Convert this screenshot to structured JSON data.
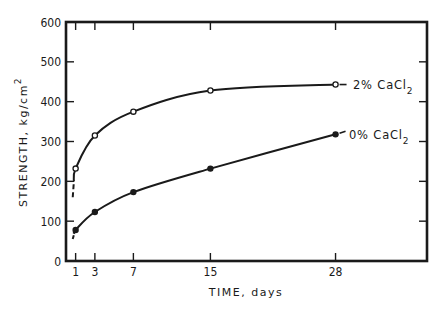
{
  "chart_data": {
    "type": "line",
    "title": "",
    "xlabel": "TIME, days",
    "ylabel": "STRENGTH, kg/cm",
    "ylabel_superscript": "2",
    "xlim": [
      0,
      37.5
    ],
    "ylim": [
      0,
      600
    ],
    "x_ticks": [
      1,
      3,
      7,
      15,
      28
    ],
    "x_tick_labels": [
      "1",
      "3",
      "7",
      "15",
      "28"
    ],
    "y_ticks": [
      0,
      100,
      200,
      300,
      400,
      500,
      600
    ],
    "y_tick_labels": [
      "0",
      "100",
      "200",
      "300",
      "400",
      "500",
      "600"
    ],
    "grid": false,
    "legend": "inline labels at line ends",
    "x": [
      1,
      3,
      7,
      15,
      28
    ],
    "series": [
      {
        "name": "2% CaCl2",
        "label_main": "2% CaCl",
        "label_sub": "2",
        "marker": "open-circle",
        "values": [
          232,
          315,
          375,
          428,
          443
        ]
      },
      {
        "name": "0% CaCl2",
        "label_main": "0% CaCl",
        "label_sub": "2",
        "marker": "filled-circle",
        "values": [
          78,
          123,
          173,
          232,
          318
        ]
      }
    ]
  }
}
